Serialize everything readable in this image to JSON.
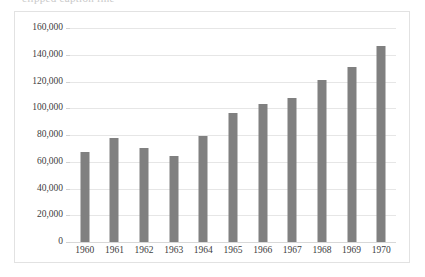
{
  "caption": {
    "clipped_text": "clipped caption line"
  },
  "chart_data": {
    "type": "bar",
    "title": "",
    "xlabel": "",
    "ylabel": "",
    "categories": [
      "1960",
      "1961",
      "1962",
      "1963",
      "1964",
      "1965",
      "1966",
      "1967",
      "1968",
      "1969",
      "1970"
    ],
    "values": [
      67000,
      78000,
      70000,
      64000,
      79000,
      96500,
      103000,
      108000,
      121500,
      130500,
      146500
    ],
    "ylim": [
      0,
      160000
    ],
    "ytick_step": 20000,
    "ytick_labels": [
      "0",
      "20,000",
      "40,000",
      "60,000",
      "80,000",
      "100,000",
      "120,000",
      "140,000",
      "160,000"
    ],
    "ytick_values": [
      0,
      20000,
      40000,
      60000,
      80000,
      100000,
      120000,
      140000,
      160000
    ],
    "grid": true,
    "legend": false,
    "legend_position": "none",
    "series": [
      {
        "name": "",
        "color": "#808080",
        "values": [
          67000,
          78000,
          70000,
          64000,
          79000,
          96500,
          103000,
          108000,
          121500,
          130500,
          146500
        ]
      }
    ],
    "colors": {
      "bar": "#808080",
      "gridline": "#e6e6e6",
      "baseline": "#d8d8d8",
      "frame_border": "#e2e2e2",
      "plot_background": "#ffffff",
      "tick_label": "#404040"
    }
  }
}
